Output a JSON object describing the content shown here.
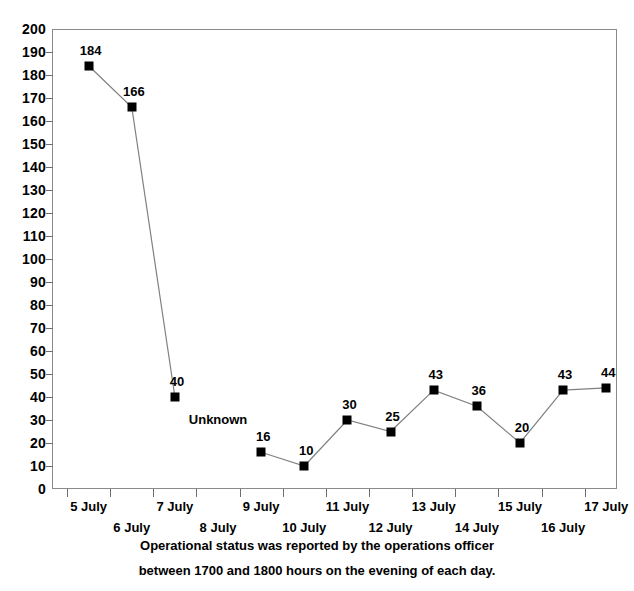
{
  "chart_data": {
    "type": "line",
    "title": "",
    "xlabel": "",
    "ylabel": "",
    "ylim": [
      0,
      200
    ],
    "ytick_step": 10,
    "yticks": [
      200,
      190,
      180,
      170,
      160,
      150,
      140,
      130,
      120,
      110,
      100,
      90,
      80,
      70,
      60,
      50,
      40,
      30,
      20,
      10,
      0
    ],
    "grid": false,
    "legend": "none",
    "marker": "filled-square",
    "line_color": "#808080",
    "marker_color": "#000000",
    "categories": [
      "5 July",
      "6 July",
      "7 July",
      "8 July",
      "9 July",
      "10 July",
      "11 July",
      "12 July",
      "13 July",
      "14 July",
      "15 July",
      "16 July",
      "17 July"
    ],
    "values": [
      184,
      166,
      40,
      null,
      16,
      10,
      30,
      25,
      43,
      36,
      20,
      43,
      44
    ],
    "point_labels": [
      "184",
      "166",
      "40",
      "Unknown",
      "16",
      "10",
      "30",
      "25",
      "43",
      "36",
      "20",
      "43",
      "44"
    ],
    "missing_label": "Unknown",
    "missing_category": "8 July",
    "annotations": [
      "Operational status was reported by the operations officer",
      "between 1700 and 1800 hours on the evening of each day."
    ]
  },
  "caption": {
    "line1": "Operational status was reported by the operations officer",
    "line2": "between 1700 and 1800 hours on the evening of each day."
  },
  "axis": {
    "y_labels": [
      "200",
      "190",
      "180",
      "170",
      "160",
      "150",
      "140",
      "130",
      "120",
      "110",
      "100",
      "90",
      "80",
      "70",
      "60",
      "50",
      "40",
      "30",
      "20",
      "10",
      "0"
    ],
    "x_labels": [
      "5 July",
      "6 July",
      "7 July",
      "8 July",
      "9 July",
      "10 July",
      "11 July",
      "12 July",
      "13 July",
      "14 July",
      "15 July",
      "16 July",
      "17 July"
    ]
  }
}
